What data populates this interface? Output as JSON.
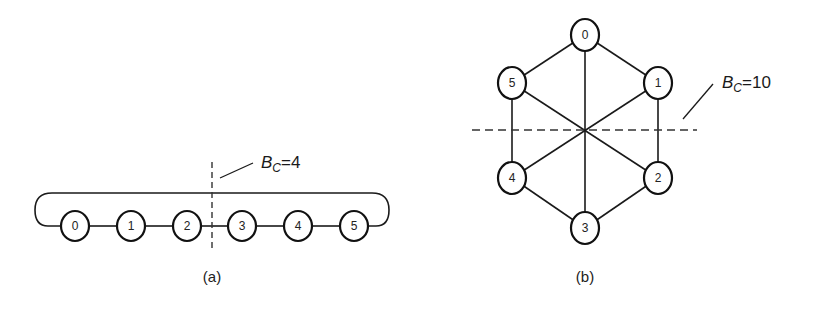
{
  "figure": {
    "panel_a": {
      "caption": "(a)",
      "layout": "linear array with wraparound (ring)",
      "nodes": [
        {
          "id": "0",
          "label": "0",
          "x": 75,
          "y": 226
        },
        {
          "id": "1",
          "label": "1",
          "x": 131,
          "y": 226
        },
        {
          "id": "2",
          "label": "2",
          "x": 187,
          "y": 226
        },
        {
          "id": "3",
          "label": "3",
          "x": 242,
          "y": 226
        },
        {
          "id": "4",
          "label": "4",
          "x": 298,
          "y": 226
        },
        {
          "id": "5",
          "label": "5",
          "x": 354,
          "y": 226
        }
      ],
      "edges": [
        [
          "0",
          "1"
        ],
        [
          "1",
          "2"
        ],
        [
          "2",
          "3"
        ],
        [
          "3",
          "4"
        ],
        [
          "4",
          "5"
        ],
        [
          "5",
          "0"
        ]
      ],
      "bisection": {
        "symbol": "B",
        "subscript": "C",
        "equals": "=",
        "value": "4"
      }
    },
    "panel_b": {
      "caption": "(b)",
      "layout": "hexagon with diagonals",
      "nodes": [
        {
          "id": "0",
          "label": "0",
          "x": 585,
          "y": 35
        },
        {
          "id": "1",
          "label": "1",
          "x": 658,
          "y": 83
        },
        {
          "id": "2",
          "label": "2",
          "x": 658,
          "y": 178
        },
        {
          "id": "3",
          "label": "3",
          "x": 585,
          "y": 228
        },
        {
          "id": "4",
          "label": "4",
          "x": 512,
          "y": 178
        },
        {
          "id": "5",
          "label": "5",
          "x": 512,
          "y": 83
        }
      ],
      "edges": [
        [
          "0",
          "1"
        ],
        [
          "1",
          "2"
        ],
        [
          "2",
          "3"
        ],
        [
          "3",
          "4"
        ],
        [
          "4",
          "5"
        ],
        [
          "5",
          "0"
        ],
        [
          "0",
          "3"
        ],
        [
          "1",
          "4"
        ],
        [
          "2",
          "5"
        ]
      ],
      "bisection": {
        "symbol": "B",
        "subscript": "C",
        "equals": "=",
        "value": "10"
      }
    }
  }
}
